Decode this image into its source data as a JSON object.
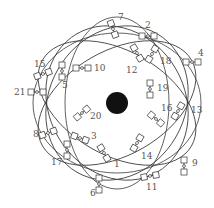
{
  "colors": {
    "earth": "#111111",
    "orbit": "#3a3a3a",
    "label": "#555555",
    "satellite_stroke": "#333333"
  },
  "earth": {
    "cx": 117,
    "cy": 103,
    "r": 11
  },
  "orbits": [
    {
      "cx": 117,
      "cy": 103,
      "rx": 86,
      "ry": 52,
      "rot": -30
    },
    {
      "cx": 117,
      "cy": 103,
      "rx": 86,
      "ry": 52,
      "rot": 30
    },
    {
      "cx": 117,
      "cy": 103,
      "rx": 86,
      "ry": 52,
      "rot": 90
    },
    {
      "cx": 117,
      "cy": 103,
      "rx": 80,
      "ry": 68,
      "rot": -60
    },
    {
      "cx": 117,
      "cy": 103,
      "rx": 80,
      "ry": 68,
      "rot": 60
    },
    {
      "cx": 117,
      "cy": 103,
      "rx": 84,
      "ry": 70,
      "rot": 0
    }
  ],
  "satellites": [
    {
      "id": "1",
      "x": 104,
      "y": 153,
      "angle": 60,
      "lx": 114,
      "ly": 167
    },
    {
      "id": "2",
      "x": 148,
      "y": 36,
      "angle": 0,
      "lx": 145,
      "ly": 28
    },
    {
      "id": "3",
      "x": 80,
      "y": 138,
      "angle": 20,
      "lx": 91,
      "ly": 139
    },
    {
      "id": "4",
      "x": 192,
      "y": 62,
      "angle": 0,
      "lx": 198,
      "ly": 56
    },
    {
      "id": "5",
      "x": 62,
      "y": 71,
      "angle": 90,
      "lx": 62,
      "ly": 88
    },
    {
      "id": "6",
      "x": 99,
      "y": 184,
      "angle": 90,
      "lx": 90,
      "ly": 196
    },
    {
      "id": "7",
      "x": 113,
      "y": 29,
      "angle": 70,
      "lx": 118,
      "ly": 20
    },
    {
      "id": "8",
      "x": 48,
      "y": 133,
      "angle": -20,
      "lx": 33,
      "ly": 137
    },
    {
      "id": "9",
      "x": 184,
      "y": 166,
      "angle": 90,
      "lx": 192,
      "ly": 166
    },
    {
      "id": "10",
      "x": 82,
      "y": 68,
      "angle": 0,
      "lx": 94,
      "ly": 71
    },
    {
      "id": "11",
      "x": 150,
      "y": 176,
      "angle": -10,
      "lx": 146,
      "ly": 190
    },
    {
      "id": "12",
      "x": 137,
      "y": 53,
      "angle": 60,
      "lx": 126,
      "ly": 73
    },
    {
      "id": "13",
      "x": 178,
      "y": 111,
      "angle": -60,
      "lx": 191,
      "ly": 113
    },
    {
      "id": "14",
      "x": 137,
      "y": 143,
      "angle": -60,
      "lx": 141,
      "ly": 159
    },
    {
      "id": "15",
      "x": 43,
      "y": 74,
      "angle": -20,
      "lx": 34,
      "ly": 67
    },
    {
      "id": "16",
      "x": 156,
      "y": 119,
      "angle": 40,
      "lx": 161,
      "ly": 111
    },
    {
      "id": "17",
      "x": 67,
      "y": 150,
      "angle": 90,
      "lx": 51,
      "ly": 165
    },
    {
      "id": "18",
      "x": 152,
      "y": 54,
      "angle": -60,
      "lx": 160,
      "ly": 64
    },
    {
      "id": "19",
      "x": 150,
      "y": 89,
      "angle": 90,
      "lx": 157,
      "ly": 91
    },
    {
      "id": "20",
      "x": 82,
      "y": 113,
      "angle": -40,
      "lx": 90,
      "ly": 119
    },
    {
      "id": "21",
      "x": 37,
      "y": 92,
      "angle": 0,
      "lx": 14,
      "ly": 95
    }
  ]
}
